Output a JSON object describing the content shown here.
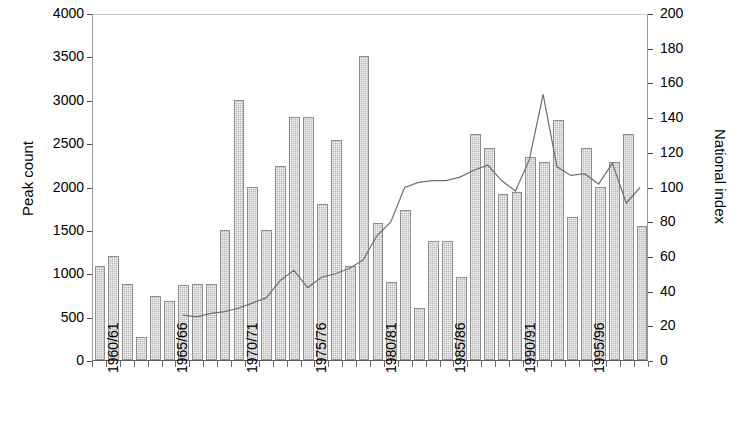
{
  "chart_data": {
    "type": "bar",
    "title": "",
    "subtitle": "",
    "xlabel": "",
    "ylabel": "Peak count",
    "y2label": "National index",
    "ylim": [
      0,
      4000
    ],
    "y2lim": [
      0,
      200
    ],
    "yticks": [
      0,
      500,
      1000,
      1500,
      2000,
      2500,
      3000,
      3500,
      4000
    ],
    "y2ticks": [
      0,
      20,
      40,
      60,
      80,
      100,
      120,
      140,
      160,
      180,
      200
    ],
    "grid": false,
    "legend": null,
    "categories": [
      "1960/61",
      "1961/62",
      "1962/63",
      "1963/64",
      "1964/65",
      "1965/66",
      "1966/67",
      "1967/68",
      "1968/69",
      "1969/70",
      "1970/71",
      "1971/72",
      "1972/73",
      "1973/74",
      "1974/75",
      "1975/76",
      "1976/77",
      "1977/78",
      "1978/79",
      "1979/80",
      "1980/81",
      "1981/82",
      "1982/83",
      "1983/84",
      "1984/85",
      "1985/86",
      "1986/87",
      "1987/88",
      "1988/89",
      "1989/90",
      "1990/91",
      "1991/92",
      "1992/93",
      "1993/94",
      "1994/95",
      "1995/96",
      "1996/97",
      "1997/98",
      "1998/99",
      "1999/00"
    ],
    "xtick_labels": [
      "1960/61",
      "1965/66",
      "1970/71",
      "1975/76",
      "1980/81",
      "1985/86",
      "1990/91",
      "1995/96"
    ],
    "xtick_indices": [
      0,
      5,
      10,
      15,
      20,
      25,
      30,
      35
    ],
    "series": [
      {
        "name": "Peak count",
        "type": "bar",
        "axis": "left",
        "color": "#b9b9b9",
        "values": [
          1080,
          1200,
          880,
          260,
          740,
          680,
          860,
          880,
          880,
          1500,
          3000,
          2000,
          1500,
          2240,
          2800,
          2800,
          1800,
          2540,
          1080,
          3500,
          1580,
          900,
          1730,
          600,
          1370,
          1370,
          960,
          2600,
          2440,
          1910,
          1940,
          2340,
          2280,
          2770,
          1650,
          2440,
          2000,
          2280,
          2600,
          1550
        ]
      },
      {
        "name": "National index",
        "type": "line",
        "axis": "right",
        "color": "#6f6f6f",
        "start_index": 6,
        "values": [
          null,
          null,
          null,
          null,
          null,
          null,
          26,
          25,
          27,
          28,
          30,
          33,
          36,
          46,
          52,
          42,
          48,
          50,
          53,
          58,
          72,
          80,
          100,
          103,
          104,
          104,
          106,
          110,
          113,
          104,
          98,
          116,
          154,
          112,
          107,
          108,
          102,
          114,
          91,
          100
        ]
      }
    ]
  }
}
